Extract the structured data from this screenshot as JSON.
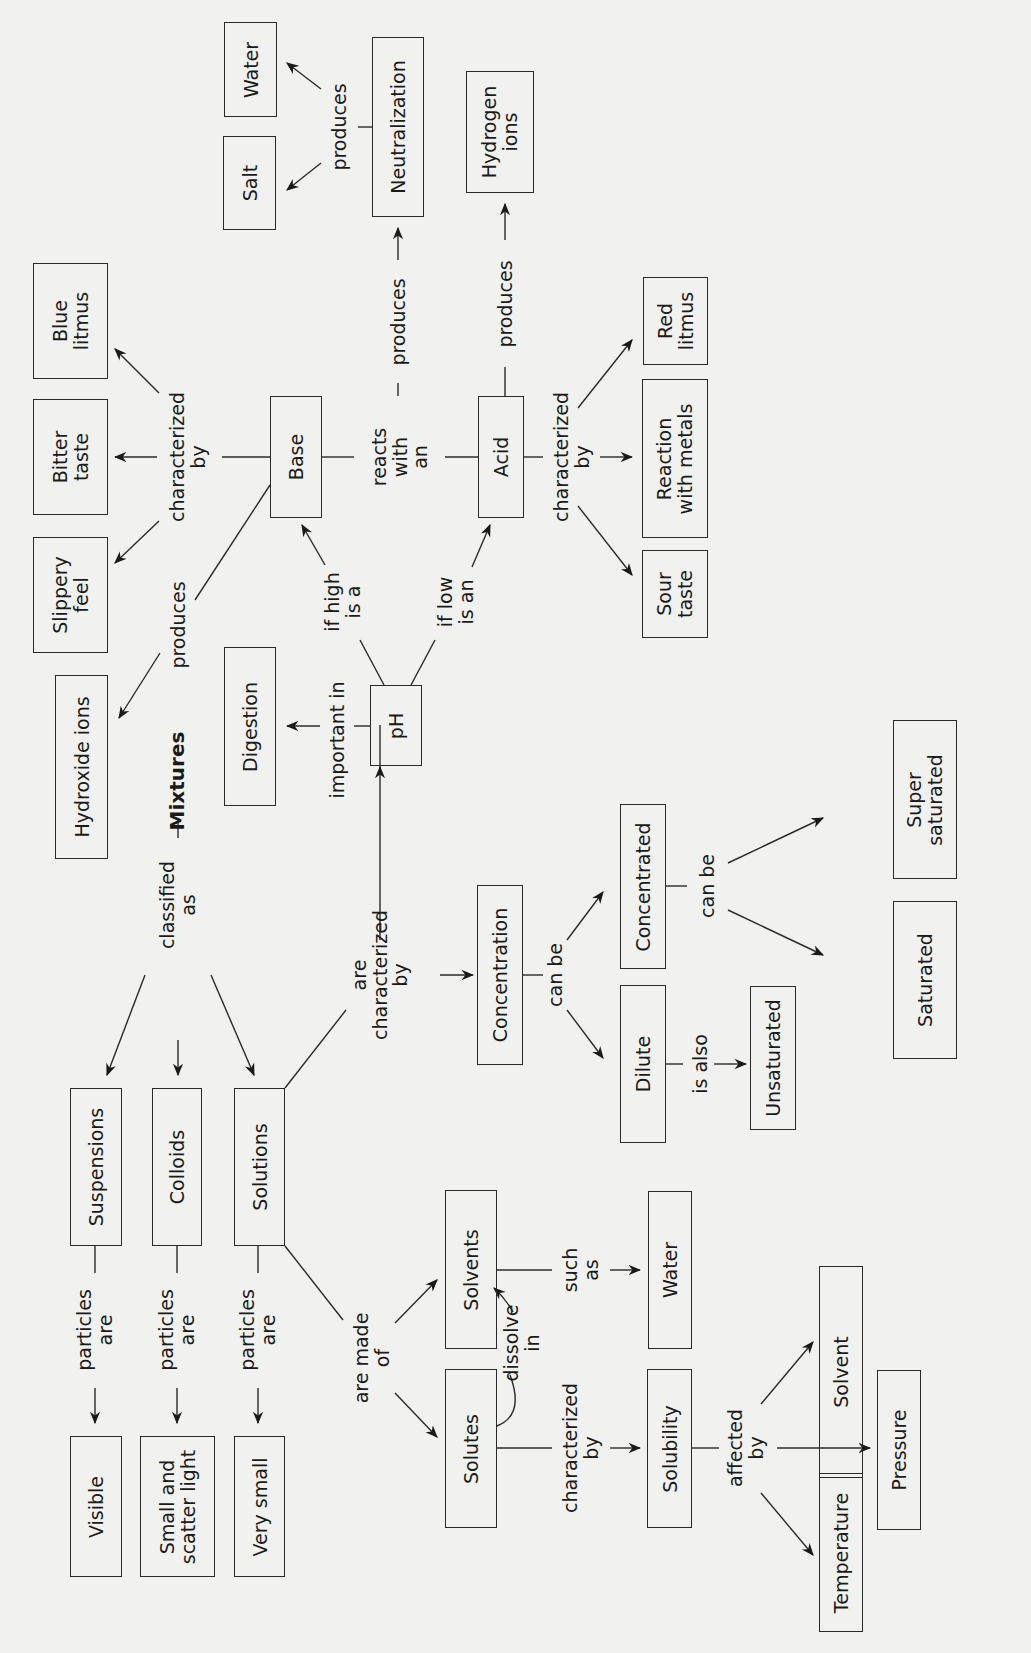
{
  "nodes": {
    "water_top": "Water",
    "salt": "Salt",
    "neutralization": "Neutralization",
    "hydrogen_ions": "Hydrogen\nions",
    "blue_litmus": "Blue\nlitmus",
    "bitter_taste": "Bitter\ntaste",
    "slippery_feel": "Slippery\nfeel",
    "hydroxide_ions": "Hydroxide ions",
    "base": "Base",
    "acid": "Acid",
    "red_litmus": "Red\nlitmus",
    "reaction_with_metals": "Reaction\nwith metals",
    "sour_taste": "Sour\ntaste",
    "digestion": "Digestion",
    "ph": "pH",
    "concentration": "Concentration",
    "concentrated": "Concentrated",
    "dilute": "Dilute",
    "unsaturated": "Unsaturated",
    "super_saturated": "Super\nsaturated",
    "saturated": "Saturated",
    "suspensions": "Suspensions",
    "colloids": "Colloids",
    "solutions": "Solutions",
    "visible": "Visible",
    "small_scatter": "Small and\nscatter light",
    "very_small": "Very small",
    "solvents": "Solvents",
    "solutes": "Solutes",
    "water_bottom": "Water",
    "solubility": "Solubility",
    "solvent": "Solvent",
    "pressure": "Pressure",
    "temperature": "Temperature"
  },
  "links": {
    "produces_salt_water": "produces",
    "produces_neutralization": "produces",
    "produces_hydrogen": "produces",
    "base_characterized": "characterized\nby",
    "base_produces": "produces",
    "reacts_with": "reacts\nwith\nan",
    "acid_characterized": "characterized\nby",
    "if_high": "if high\nis a",
    "if_low": "if low\nis an",
    "important_in": "important in",
    "classified_as": "classified\nas",
    "are_characterized": "are\ncharacterized\nby",
    "conc_can_be": "can be",
    "concd_can_be": "can be",
    "is_also": "is also",
    "particles_1": "particles\nare",
    "particles_2": "particles\nare",
    "particles_3": "particles\nare",
    "are_made_of": "are made\nof",
    "dissolve_in": "dissolve\nin",
    "such_as": "such\nas",
    "solutes_characterized": "characterized\nby",
    "affected_by": "affected\nby"
  }
}
